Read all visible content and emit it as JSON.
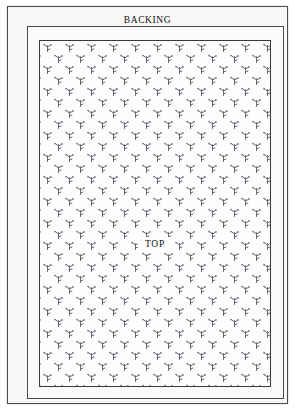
{
  "diagram": {
    "layers": [
      {
        "id": "backing",
        "label": "BACKING",
        "order": 1,
        "position": "outer"
      },
      {
        "id": "batting",
        "label": "BATTING",
        "order": 2,
        "position": "middle"
      },
      {
        "id": "top",
        "label": "TOP",
        "order": 3,
        "position": "inner"
      }
    ]
  },
  "labels": {
    "backing": "BACKING",
    "batting": "BATTING",
    "top": "TOP"
  },
  "pattern": {
    "name": "sprig-motif-fabric",
    "description": "staggered grid of small floral sprig marks",
    "motif_color": "#555b66",
    "background_color": "#fdfdfd",
    "tile_width_px": 22,
    "tile_height_px": 22
  },
  "colors": {
    "page_background": "#ffffff",
    "backing_fill": "#f7f7f7",
    "batting_fill": "#fafafa",
    "top_fill": "#fdfdfd",
    "border_line": "#4a4a4a",
    "text": "#111111"
  }
}
